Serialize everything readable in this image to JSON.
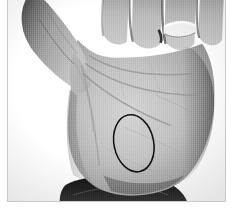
{
  "image": {
    "kind": "photograph",
    "subject": "open human palm with hand-drawn ellipse annotation",
    "color_mode": "grayscale",
    "width_px": 239,
    "height_px": 215,
    "background_color": "#ffffff",
    "frame": {
      "visible": true,
      "border_color": "#c9c9c9",
      "left_px": 7,
      "top_px": 0,
      "width_px": 219,
      "height_px": 202
    },
    "palette": {
      "background": "#ffffff",
      "skin_light": "#cfcfcf",
      "skin_mid": "#b4b4b4",
      "skin_shadow": "#8e8e8e",
      "skin_dark": "#5e5e5e",
      "crease": "#7d7d7d",
      "sleeve_dark": "#1c1c1c",
      "sleeve_mid": "#3a3a3a",
      "ring_highlight": "#f2f2f2",
      "annotation_stroke": "#111111"
    },
    "parts": [
      {
        "name": "thumb",
        "label": "Thumb",
        "position": "upper-left, extended outward"
      },
      {
        "name": "index-finger",
        "label": "Index finger",
        "position": "top, left of center"
      },
      {
        "name": "middle-finger",
        "label": "Middle finger",
        "position": "top center"
      },
      {
        "name": "ring-finger",
        "label": "Ring finger",
        "position": "top right of center",
        "wears_ring": true
      },
      {
        "name": "little-finger",
        "label": "Little finger",
        "position": "top right, partly cropped"
      },
      {
        "name": "palm",
        "label": "Palm",
        "position": "center"
      },
      {
        "name": "wrist",
        "label": "Wrist",
        "position": "bottom center"
      },
      {
        "name": "sleeve",
        "label": "Dark sleeve cuff",
        "position": "bottom, cropped by frame"
      }
    ],
    "ring": {
      "present": true,
      "label": "Silver band ring",
      "finger": "ring finger",
      "color": "#f2f2f2",
      "center_x_px": 176,
      "center_y_px": 30
    },
    "annotation": {
      "type": "ellipse",
      "label": "Hand-drawn ellipse highlighting the hypothenar region of the palm",
      "stroke_color": "#111111",
      "stroke_width_px": 1.6,
      "center_x_px": 134,
      "center_y_px": 144,
      "radius_x_px": 20,
      "radius_y_px": 29,
      "rotation_deg": -12
    },
    "palm_creases": [
      {
        "name": "heart-line",
        "label": "Upper transverse crease"
      },
      {
        "name": "head-line",
        "label": "Middle transverse crease"
      },
      {
        "name": "life-line",
        "label": "Thenar arc crease"
      },
      {
        "name": "thenar-fold",
        "label": "Thumb base fold"
      }
    ]
  }
}
